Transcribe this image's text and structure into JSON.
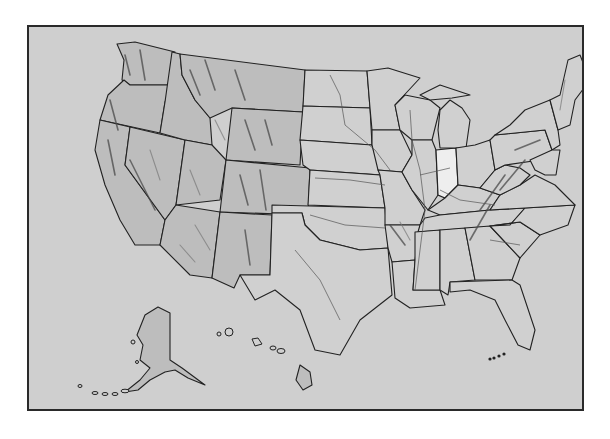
{
  "map": {
    "type": "outline relief map",
    "region": "United States",
    "highlighted_state": "Indiana",
    "insets": [
      "Alaska",
      "Hawaii"
    ],
    "labels": [],
    "colors": {
      "background": "#cfcfcf",
      "state_fill": "#d0d0d0",
      "relief_fill": "#bdbdbd",
      "highlight_fill": "#eeeeee",
      "border": "#222222",
      "frame": "#2a2a2a",
      "page": "#ffffff"
    }
  }
}
